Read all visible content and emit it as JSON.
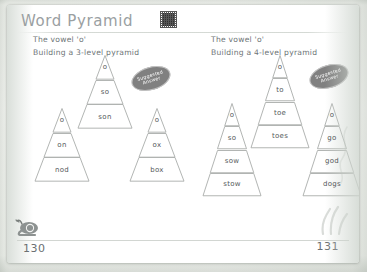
{
  "worksheet": {
    "title": "Word Pyramid",
    "qr_icon": "qr-code-icon",
    "page_left": "130",
    "page_right": "131",
    "accent_stamp_color": "#6f6f6f",
    "paper_color": "#ffffff",
    "frame_color": "#dfe3de"
  },
  "sections": [
    {
      "id": "left",
      "lead_1": "The vowel 'o'",
      "lead_2": "Building a 3-level pyramid",
      "stamp": {
        "line1": "Suggested",
        "line2": "Answer"
      },
      "pyramids": [
        {
          "id": "son",
          "levels": 3,
          "words": [
            "o",
            "so",
            "son"
          ]
        },
        {
          "id": "nod",
          "levels": 3,
          "words": [
            "o",
            "on",
            "nod"
          ]
        },
        {
          "id": "box",
          "levels": 3,
          "words": [
            "o",
            "ox",
            "box"
          ]
        }
      ]
    },
    {
      "id": "right",
      "lead_1": "The vowel 'o'",
      "lead_2": "Building a 4-level pyramid",
      "stamp": {
        "line1": "Suggested",
        "line2": "Answer"
      },
      "pyramids": [
        {
          "id": "toes",
          "levels": 4,
          "words": [
            "o",
            "to",
            "toe",
            "toes"
          ]
        },
        {
          "id": "stow",
          "levels": 4,
          "words": [
            "o",
            "so",
            "sow",
            "stow"
          ]
        },
        {
          "id": "dogs",
          "levels": 4,
          "words": [
            "o",
            "go",
            "god",
            "dogs"
          ]
        }
      ]
    }
  ],
  "decorations": {
    "snail_icon": "snail-icon",
    "grass_icon": "grass-icon",
    "leaf_icon": "leaf-swirl-icon"
  }
}
